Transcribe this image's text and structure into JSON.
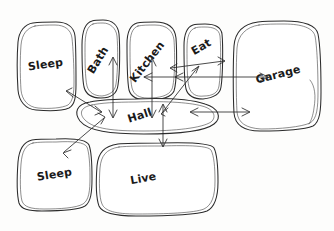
{
  "diagram": {
    "type": "hand-drawn room adjacency / bubble diagram",
    "background_color": "#fdfdfc",
    "ink_color": "#2b2b2b",
    "rooms": [
      {
        "id": "sleep-top",
        "label": "Sleep",
        "shape": "rounded-rectangle",
        "x": 17,
        "y": 22,
        "w": 59,
        "h": 89,
        "label_x": 46,
        "label_y": 68,
        "label_rotate": -8
      },
      {
        "id": "bath",
        "label": "Bath",
        "shape": "rounded-rectangle",
        "x": 82,
        "y": 20,
        "w": 38,
        "h": 78,
        "label_x": 101,
        "label_y": 62,
        "label_rotate": -58
      },
      {
        "id": "kitchen",
        "label": "Kitchen",
        "shape": "rounded-rectangle",
        "x": 126,
        "y": 22,
        "w": 50,
        "h": 78,
        "label_x": 150,
        "label_y": 64,
        "label_rotate": -52
      },
      {
        "id": "eat",
        "label": "Eat",
        "shape": "rounded-rectangle",
        "x": 184,
        "y": 24,
        "w": 39,
        "h": 75,
        "label_x": 203,
        "label_y": 50,
        "label_rotate": -30
      },
      {
        "id": "garage",
        "label": "Garage",
        "shape": "rounded-rectangle",
        "x": 233,
        "y": 21,
        "w": 88,
        "h": 110,
        "label_x": 279,
        "label_y": 78,
        "label_rotate": -14
      },
      {
        "id": "hall",
        "label": "Hall",
        "shape": "ellipse",
        "x": 74,
        "y": 99,
        "w": 148,
        "h": 35,
        "label_x": 141,
        "label_y": 119,
        "label_rotate": -18
      },
      {
        "id": "sleep-bottom",
        "label": "Sleep",
        "shape": "rounded-rectangle",
        "x": 18,
        "y": 139,
        "w": 74,
        "h": 71,
        "label_x": 55,
        "label_y": 178,
        "label_rotate": -9
      },
      {
        "id": "live",
        "label": "Live",
        "shape": "rounded-rectangle",
        "x": 96,
        "y": 143,
        "w": 123,
        "h": 73,
        "label_x": 144,
        "label_y": 182,
        "label_rotate": -10
      }
    ],
    "connections": [
      {
        "id": "hall-sleep-top",
        "from": "hall",
        "to": "sleep-top",
        "arrow": "double",
        "x1": 100,
        "y1": 111,
        "x2": 67,
        "y2": 91
      },
      {
        "id": "hall-bath",
        "from": "hall",
        "to": "bath",
        "arrow": "double",
        "x1": 113,
        "y1": 116,
        "x2": 113,
        "y2": 58
      },
      {
        "id": "hall-kitchen",
        "from": "hall",
        "to": "kitchen",
        "arrow": "double",
        "x1": 152,
        "y1": 116,
        "x2": 152,
        "y2": 59
      },
      {
        "id": "hall-eat",
        "from": "hall",
        "to": "eat",
        "arrow": "double",
        "x1": 163,
        "y1": 112,
        "x2": 197,
        "y2": 66
      },
      {
        "id": "kitchen-eat",
        "from": "kitchen",
        "to": "eat",
        "arrow": "double",
        "x1": 173,
        "y1": 67,
        "x2": 223,
        "y2": 61
      },
      {
        "id": "eat-garage",
        "from": "eat",
        "to": "garage",
        "arrow": "double",
        "x1": 219,
        "y1": 85,
        "x2": 266,
        "y2": 78
      },
      {
        "id": "hall-garage",
        "from": "hall",
        "to": "garage",
        "arrow": "double",
        "x1": 192,
        "y1": 113,
        "x2": 248,
        "y2": 111
      },
      {
        "id": "hall-sleep-bottom",
        "from": "hall",
        "to": "sleep-bottom",
        "arrow": "double",
        "x1": 103,
        "y1": 118,
        "x2": 66,
        "y2": 152
      },
      {
        "id": "hall-live",
        "from": "hall",
        "to": "live",
        "arrow": "double",
        "x1": 163,
        "y1": 106,
        "x2": 163,
        "y2": 144
      }
    ]
  }
}
